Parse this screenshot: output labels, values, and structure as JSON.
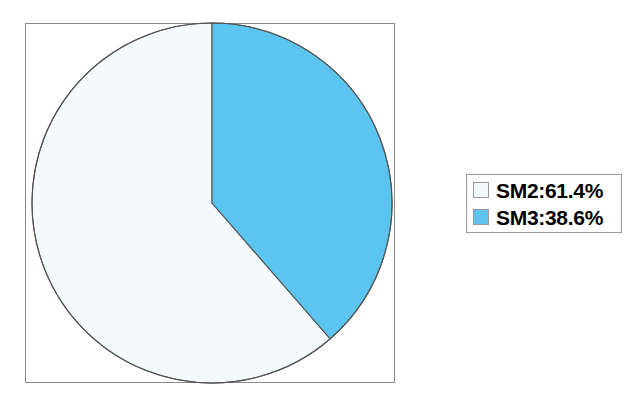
{
  "chart_data": {
    "type": "pie",
    "title": "",
    "labels": [
      "SM2",
      "SM3"
    ],
    "values": [
      61.4,
      38.6
    ],
    "value_unit": "%",
    "legend_entries": [
      {
        "key": "SM2",
        "label": "SM2:61.4%",
        "value": 61.4,
        "color": "#f4fafc"
      },
      {
        "key": "SM3",
        "label": "SM3:38.6%",
        "value": 38.6,
        "color": "#5bc4f0"
      }
    ],
    "legend_position": "right",
    "start_angle_deg": 0,
    "direction": "counterclockwise",
    "grid": false,
    "xlabel": "",
    "ylabel": ""
  },
  "figure": {
    "background_color": "#ffffff",
    "frame_color": "#8a8a8a",
    "slice_outline_color": "#555555"
  },
  "slices": [
    {
      "name": "SM2",
      "percent": 61.4,
      "fill": "#f4fafc"
    },
    {
      "name": "SM3",
      "percent": 38.6,
      "fill": "#5bc4f0"
    }
  ]
}
